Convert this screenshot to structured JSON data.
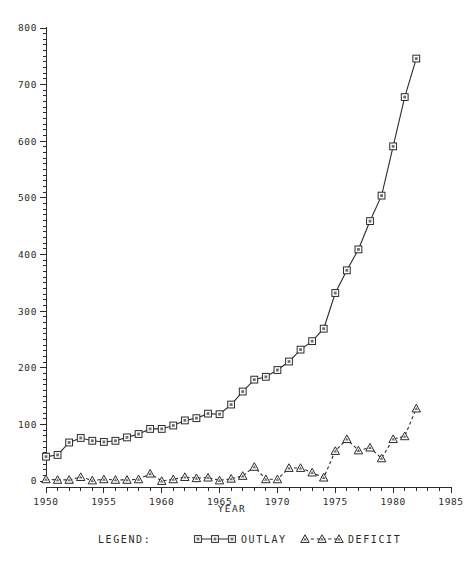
{
  "chart_data": {
    "type": "line",
    "title": "",
    "xlabel": "YEAR",
    "ylabel": "",
    "xlim": [
      1950,
      1985
    ],
    "ylim": [
      0,
      800
    ],
    "grid": false,
    "x_ticks": [
      1950,
      1955,
      1960,
      1965,
      1970,
      1975,
      1980,
      1985
    ],
    "x_tick_labels": [
      "1950",
      "1955",
      "1960",
      "1965",
      "1970",
      "1975",
      "1980",
      "1985"
    ],
    "y_ticks": [
      0,
      100,
      200,
      300,
      400,
      500,
      600,
      700,
      800
    ],
    "y_tick_labels": [
      "0",
      "100",
      "200",
      "300",
      "400",
      "500",
      "600",
      "700",
      "800"
    ],
    "x_minor_step": 1,
    "y_minor_step": 10,
    "legend_position": "below-plot",
    "legend_title": "LEGEND:",
    "x": [
      1950,
      1951,
      1952,
      1953,
      1954,
      1955,
      1956,
      1957,
      1958,
      1959,
      1960,
      1961,
      1962,
      1963,
      1964,
      1965,
      1966,
      1967,
      1968,
      1969,
      1970,
      1971,
      1972,
      1973,
      1974,
      1975,
      1976,
      1977,
      1978,
      1979,
      1980,
      1981,
      1982
    ],
    "series": [
      {
        "name": "OUTLAY",
        "marker": "square",
        "linestyle": "solid",
        "values": [
          43,
          46,
          68,
          76,
          71,
          69,
          71,
          77,
          83,
          92,
          92,
          98,
          107,
          111,
          119,
          118,
          135,
          158,
          179,
          184,
          196,
          211,
          232,
          247,
          269,
          332,
          372,
          409,
          459,
          504,
          591,
          678,
          746
        ]
      },
      {
        "name": "DEFICIT",
        "marker": "triangle",
        "linestyle": "dashed",
        "values": [
          3,
          2,
          2,
          7,
          1,
          3,
          2,
          2,
          3,
          13,
          0,
          3,
          7,
          5,
          6,
          1,
          4,
          9,
          25,
          3,
          3,
          23,
          23,
          15,
          6,
          53,
          74,
          54,
          59,
          40,
          74,
          79,
          128
        ]
      }
    ]
  },
  "legend": {
    "label": "LEGEND:",
    "entries": [
      {
        "label": "OUTLAY",
        "marker": "square-marker-icon",
        "linestyle": "solid"
      },
      {
        "label": "DEFICIT",
        "marker": "triangle-marker-icon",
        "linestyle": "dashed"
      }
    ]
  },
  "axes": {
    "x_title": "YEAR",
    "y_title": ""
  }
}
